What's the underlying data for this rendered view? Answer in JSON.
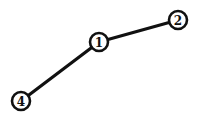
{
  "diagram": {
    "type": "graph",
    "nodes": [
      {
        "id": "1",
        "label": "1",
        "x": 99,
        "y": 42
      },
      {
        "id": "2",
        "label": "2",
        "x": 178,
        "y": 20
      },
      {
        "id": "4",
        "label": "4",
        "x": 21,
        "y": 101
      }
    ],
    "edges": [
      {
        "from": "4",
        "to": "1"
      },
      {
        "from": "1",
        "to": "2"
      }
    ],
    "colors": {
      "stroke": "#111111",
      "background": "#ffffff"
    }
  }
}
